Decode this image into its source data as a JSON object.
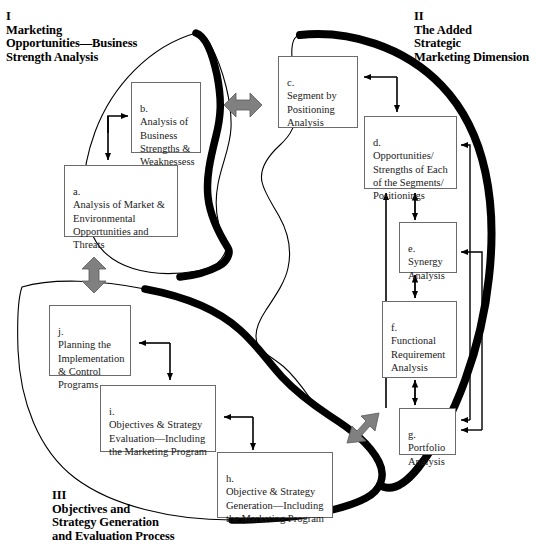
{
  "diagram": {
    "background_color": "#ffffff",
    "outline_color": "#000000",
    "box_border_color": "#6b6b6b",
    "arrow_color": "#000000",
    "connector_arrow_color": "#808080",
    "sections": [
      {
        "numeral": "I",
        "title": "Marketing\nOpportunities—Business\nStrength Analysis",
        "text": "I\nMarketing\nOpportunities—Business\nStrength Analysis"
      },
      {
        "numeral": "II",
        "title": "The Added\nStrategic\nMarketing Dimension",
        "text": "II\nThe Added\nStrategic\nMarketing Dimension"
      },
      {
        "numeral": "III",
        "title": "Objectives and\nStrategy Generation\nand Evaluation Process",
        "text": "III\nObjectives and\nStrategy Generation\nand Evaluation Process"
      }
    ],
    "nodes": [
      {
        "key": "a",
        "marker": "a.",
        "text": "a.\nAnalysis of Market &\nEnvironmental\nOpportunities and\nThreats"
      },
      {
        "key": "b",
        "marker": "b.",
        "text": "b.\nAnalysis of\nBusiness\nStrengths &\nWeaknessess"
      },
      {
        "key": "c",
        "marker": "c.",
        "text": "c.\nSegment by\nPositioning\nAnalysis"
      },
      {
        "key": "d",
        "marker": "d.",
        "text": "d.\nOpportunities/\nStrengths of Each\nof the Segments/\nPositionings"
      },
      {
        "key": "e",
        "marker": "e.",
        "text": "e.\nSynergy\nAnalysis"
      },
      {
        "key": "f",
        "marker": "f.",
        "text": "f.\nFunctional\nRequirement\nAnalysis"
      },
      {
        "key": "g",
        "marker": "g.",
        "text": "g.\nPortfolio\nAnalysis"
      },
      {
        "key": "h",
        "marker": "h.",
        "text": "h.\nObjective & Strategy\nGeneration—Including\nthe Marketing Program"
      },
      {
        "key": "i",
        "marker": "i.",
        "text": "i.\nObjectives & Strategy\nEvaluation—Including\nthe Marketing Program"
      },
      {
        "key": "j",
        "marker": "j.",
        "text": "j.\nPlanning the\nImplementation\n& Control\nPrograms"
      }
    ]
  }
}
